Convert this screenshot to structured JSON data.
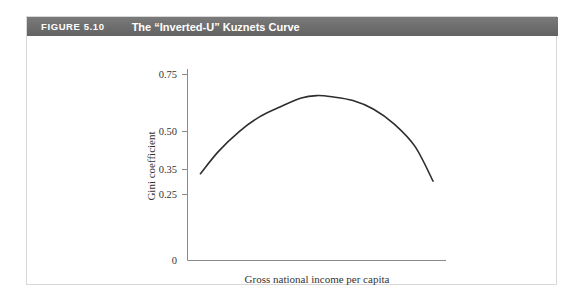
{
  "figure": {
    "number_label": "FIGURE 5.10",
    "title": "The “Inverted-U” Kuznets Curve",
    "header_background": "#6e6e6e",
    "header_text_color": "#ffffff",
    "border_color": "#d8d8d8",
    "background": "#ffffff"
  },
  "chart_data": {
    "type": "line",
    "title": "The “Inverted-U” Kuznets Curve",
    "xlabel": "Gross national income per capita",
    "ylabel": "Gini coefficient",
    "ylim": [
      0,
      0.79
    ],
    "xlim": [
      0,
      1
    ],
    "ytick_labels": [
      "0.75",
      "0.50",
      "0.35",
      "0.25",
      "0"
    ],
    "ytick_values": [
      0.75,
      0.5,
      0.35,
      0.25,
      0
    ],
    "xtick_labels": [],
    "grid": false,
    "legend": null,
    "curve_color": "#2d2d2d",
    "series": [
      {
        "name": "Kuznets curve",
        "x": [
          0.05,
          0.12,
          0.2,
          0.28,
          0.36,
          0.44,
          0.5,
          0.56,
          0.64,
          0.72,
          0.8,
          0.88,
          0.95
        ],
        "values": [
          0.35,
          0.44,
          0.52,
          0.58,
          0.62,
          0.655,
          0.665,
          0.66,
          0.645,
          0.61,
          0.55,
          0.46,
          0.32
        ]
      }
    ],
    "annotations": []
  }
}
